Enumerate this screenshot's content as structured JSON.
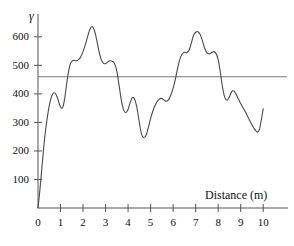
{
  "chart_data": {
    "type": "line",
    "title": "",
    "subtitle": "",
    "xlabel": "Distance (m)",
    "ylabel": "γ",
    "xlim": [
      0,
      11.1
    ],
    "ylim": [
      0,
      680
    ],
    "grid": false,
    "legend": "none",
    "xticks": [
      0,
      1,
      2,
      3,
      4,
      5,
      6,
      7,
      8,
      9,
      10
    ],
    "xtick_labels": [
      "0",
      "1",
      "2",
      "3",
      "4",
      "5",
      "6",
      "7",
      "8",
      "9",
      "10"
    ],
    "yticks": [
      100,
      200,
      300,
      400,
      500,
      600
    ],
    "ytick_labels": [
      "100",
      "200",
      "300",
      "400",
      "500",
      "600"
    ],
    "line_color": "#4a4a4a",
    "axis_color": "#555555",
    "reference_line": {
      "name": "mean-level",
      "orientation": "horizontal",
      "value": 460,
      "x_start": 0,
      "x_end": 11.05,
      "color": "#777777"
    },
    "series": [
      {
        "name": "gamma-profile",
        "color": "#4a4a4a",
        "x": [
          0.0,
          0.08,
          0.16,
          0.24,
          0.32,
          0.4,
          0.48,
          0.56,
          0.64,
          0.72,
          0.8,
          0.88,
          0.96,
          1.04,
          1.12,
          1.2,
          1.28,
          1.36,
          1.44,
          1.52,
          1.6,
          1.7,
          1.8,
          1.9,
          2.0,
          2.1,
          2.2,
          2.3,
          2.4,
          2.5,
          2.6,
          2.7,
          2.8,
          2.9,
          3.0,
          3.1,
          3.2,
          3.3,
          3.4,
          3.5,
          3.6,
          3.7,
          3.8,
          3.9,
          4.0,
          4.1,
          4.2,
          4.3,
          4.4,
          4.5,
          4.6,
          4.7,
          4.8,
          4.9,
          5.0,
          5.1,
          5.2,
          5.3,
          5.4,
          5.5,
          5.6,
          5.7,
          5.8,
          5.9,
          6.0,
          6.1,
          6.2,
          6.3,
          6.4,
          6.5,
          6.6,
          6.7,
          6.8,
          6.9,
          7.0,
          7.1,
          7.2,
          7.3,
          7.4,
          7.5,
          7.6,
          7.7,
          7.8,
          7.9,
          8.0,
          8.1,
          8.2,
          8.3,
          8.4,
          8.5,
          8.6,
          8.7,
          8.8,
          8.9,
          9.0,
          9.2,
          9.4,
          9.6,
          9.75,
          9.85,
          10.0
        ],
        "y": [
          0,
          60,
          130,
          200,
          262,
          310,
          350,
          380,
          398,
          404,
          398,
          382,
          362,
          350,
          358,
          392,
          440,
          480,
          506,
          516,
          518,
          516,
          520,
          530,
          548,
          572,
          600,
          626,
          636,
          624,
          592,
          552,
          522,
          508,
          506,
          512,
          516,
          514,
          506,
          480,
          430,
          378,
          344,
          334,
          346,
          372,
          388,
          380,
          348,
          300,
          258,
          247,
          256,
          282,
          314,
          340,
          360,
          374,
          382,
          384,
          378,
          374,
          380,
          396,
          420,
          452,
          490,
          522,
          540,
          546,
          544,
          552,
          576,
          604,
          616,
          618,
          608,
          586,
          560,
          544,
          540,
          544,
          548,
          542,
          520,
          474,
          420,
          386,
          378,
          390,
          408,
          410,
          398,
          382,
          366,
          338,
          306,
          278,
          266,
          282,
          348
        ]
      }
    ]
  },
  "axes": {
    "y_axis_name": "gamma-axis",
    "x_axis_name": "distance-axis"
  }
}
